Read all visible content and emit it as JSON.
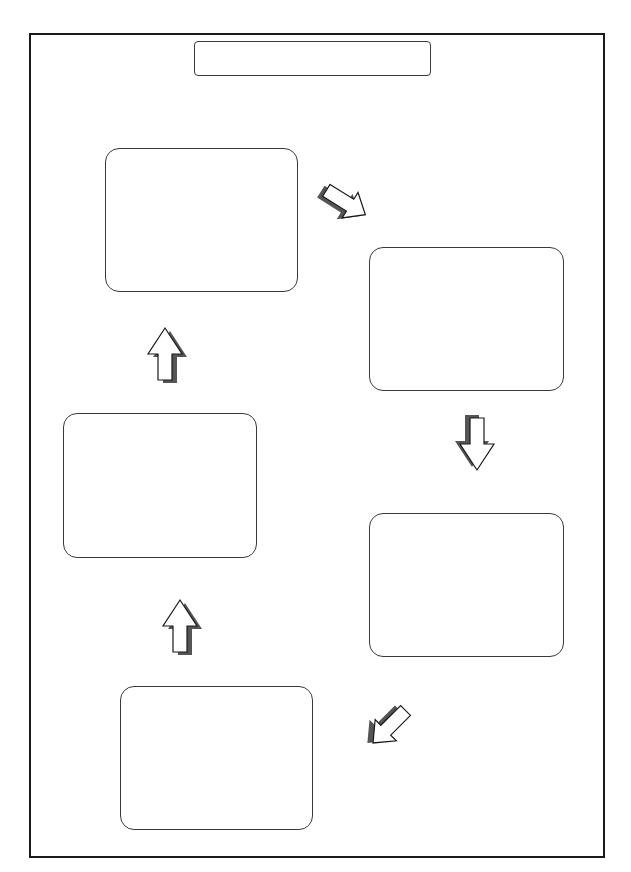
{
  "diagram": {
    "type": "cycle-flow-template",
    "title": "",
    "colors": {
      "frame_border": "#1a1a1a",
      "box_border": "#3a3a3a",
      "arrow_fill": "#ffffff",
      "arrow_outline": "#1a1a1a",
      "arrow_shadow": "#555555"
    },
    "boxes": [
      {
        "id": "step-1",
        "label": ""
      },
      {
        "id": "step-2",
        "label": ""
      },
      {
        "id": "step-3",
        "label": ""
      },
      {
        "id": "step-4",
        "label": ""
      },
      {
        "id": "step-5",
        "label": ""
      }
    ],
    "arrows": [
      {
        "from": "step-1",
        "to": "step-2",
        "direction": "down-right"
      },
      {
        "from": "step-2",
        "to": "step-3",
        "direction": "down"
      },
      {
        "from": "step-3",
        "to": "step-4",
        "direction": "down-left"
      },
      {
        "from": "step-4",
        "to": "step-5",
        "direction": "up"
      },
      {
        "from": "step-5",
        "to": "step-1",
        "direction": "up"
      }
    ]
  }
}
